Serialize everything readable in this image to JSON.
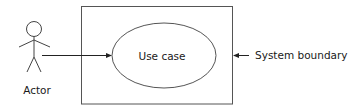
{
  "diagram": {
    "type": "UML use case diagram",
    "colors": {
      "stroke": "#444444",
      "text": "#1a1a1a",
      "background": "#ffffff"
    },
    "actor": {
      "label": "Actor",
      "icon": "stick-figure-icon"
    },
    "use_case": {
      "label": "Use case",
      "shape": "ellipse"
    },
    "system_boundary": {
      "label": "System boundary",
      "shape": "rectangle"
    },
    "connections": [
      {
        "from": "actor",
        "to": "use_case",
        "style": "solid-arrow"
      },
      {
        "from": "system_boundary_label",
        "to": "system_boundary",
        "style": "solid-arrow"
      }
    ]
  }
}
